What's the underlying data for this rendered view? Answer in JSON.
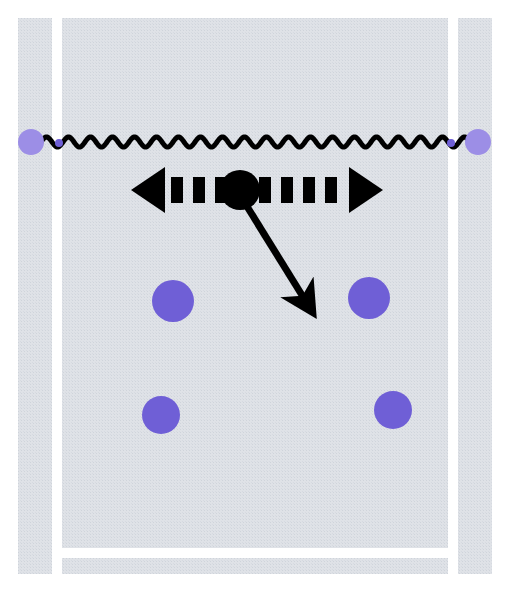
{
  "canvas": {
    "width": 509,
    "height": 592,
    "background_color": "#ffffff",
    "panel_color": "#dcdfe4",
    "panel_texture": "halftone-dot-grid",
    "frame_color": "#ffffff"
  },
  "diagram": {
    "title": ""
  },
  "panel": {
    "name": "textured-panel",
    "x": 18,
    "y": 18,
    "width": 474,
    "height": 556,
    "fill": "#dcdfe4"
  },
  "frame_gaps": {
    "left_gap": {
      "x": 52,
      "y": 18,
      "width": 10,
      "height": 556,
      "color": "#ffffff"
    },
    "right_gap": {
      "x": 448,
      "y": 18,
      "width": 10,
      "height": 556,
      "color": "#ffffff"
    },
    "bottom_gap": {
      "x": 52,
      "y": 548,
      "width": 406,
      "height": 10,
      "color": "#ffffff"
    }
  },
  "wavy_line": {
    "name": "wavy-connector",
    "color": "#000000",
    "stroke_width": 5,
    "y": 142,
    "x_start": 30,
    "x_end": 478,
    "period": 22,
    "amplitude": 5
  },
  "endpoints": [
    {
      "id": "left-endpoint",
      "cx": 31,
      "cy": 142,
      "r": 13,
      "color": "#9c8ee6"
    },
    {
      "id": "right-endpoint",
      "cx": 478,
      "cy": 142,
      "r": 13,
      "color": "#9c8ee6"
    },
    {
      "id": "left-gap-marker",
      "cx": 59,
      "cy": 143,
      "r": 4,
      "color": "#6f5fd6"
    },
    {
      "id": "right-gap-marker",
      "cx": 451,
      "cy": 143,
      "r": 4,
      "color": "#6f5fd6"
    }
  ],
  "hub_node": {
    "name": "hub-node",
    "cx": 240,
    "cy": 190,
    "r": 20,
    "color": "#000000"
  },
  "dashed_double_arrow": {
    "name": "dashed-double-arrow",
    "color": "#000000",
    "y": 190,
    "x_left_tip": 131,
    "x_right_tip": 383,
    "dash_width": 12,
    "dash_gap": 10,
    "dash_height": 26,
    "head_width": 34,
    "head_height": 46
  },
  "diagonal_arrow": {
    "name": "diagonal-arrow",
    "color": "#000000",
    "x_start": 243,
    "y_start": 200,
    "x_end": 305,
    "y_end": 300,
    "stroke_width": 7,
    "head_length": 34,
    "head_width": 30
  },
  "purple_dots": [
    {
      "id": "dot-top-left",
      "cx": 173,
      "cy": 301,
      "r": 21,
      "color": "#6f5fd6"
    },
    {
      "id": "dot-top-right",
      "cx": 369,
      "cy": 298,
      "r": 21,
      "color": "#6f5fd6"
    },
    {
      "id": "dot-bottom-left",
      "cx": 161,
      "cy": 415,
      "r": 19,
      "color": "#6f5fd6"
    },
    {
      "id": "dot-bottom-right",
      "cx": 393,
      "cy": 410,
      "r": 19,
      "color": "#6f5fd6"
    }
  ],
  "colors": {
    "purple": "#6f5fd6",
    "light_purple": "#9c8ee6",
    "black": "#000000",
    "panel_gray": "#dcdfe4",
    "white": "#ffffff"
  }
}
